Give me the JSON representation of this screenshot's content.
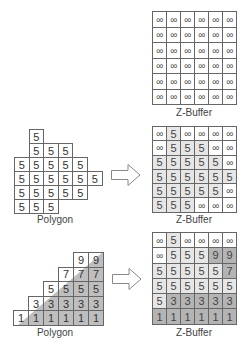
{
  "top": {
    "zbuffer": {
      "label": "Z-Buffer",
      "rows": [
        [
          "∞",
          "∞",
          "∞",
          "∞",
          "∞",
          "∞"
        ],
        [
          "∞",
          "∞",
          "∞",
          "∞",
          "∞",
          "∞"
        ],
        [
          "∞",
          "∞",
          "∞",
          "∞",
          "∞",
          "∞"
        ],
        [
          "∞",
          "∞",
          "∞",
          "∞",
          "∞",
          "∞"
        ],
        [
          "∞",
          "∞",
          "∞",
          "∞",
          "∞",
          "∞"
        ],
        [
          "∞",
          "∞",
          "∞",
          "∞",
          "∞",
          "∞"
        ]
      ]
    }
  },
  "middle": {
    "polygon": {
      "label": "Polygon",
      "rows": [
        {
          "start": 1,
          "values": [
            "5"
          ]
        },
        {
          "start": 1,
          "values": [
            "5",
            "5",
            "5"
          ]
        },
        {
          "start": 0,
          "values": [
            "5",
            "5",
            "5",
            "5",
            "5"
          ]
        },
        {
          "start": 0,
          "values": [
            "5",
            "5",
            "5",
            "5",
            "5",
            "5"
          ]
        },
        {
          "start": 0,
          "values": [
            "5",
            "5",
            "5",
            "5",
            "5"
          ]
        },
        {
          "start": 0,
          "values": [
            "5",
            "5",
            "5"
          ]
        }
      ]
    },
    "zbuffer": {
      "label": "Z-Buffer",
      "rows": [
        [
          "∞",
          "5",
          "∞",
          "∞",
          "∞",
          "∞"
        ],
        [
          "∞",
          "5",
          "5",
          "5",
          "∞",
          "∞"
        ],
        [
          "5",
          "5",
          "5",
          "5",
          "5",
          "∞"
        ],
        [
          "5",
          "5",
          "5",
          "5",
          "5",
          "5"
        ],
        [
          "5",
          "5",
          "5",
          "5",
          "5",
          "∞"
        ],
        [
          "5",
          "5",
          "5",
          "∞",
          "∞",
          "∞"
        ]
      ],
      "shade": [
        [
          0,
          1,
          0,
          0,
          0,
          0
        ],
        [
          0,
          1,
          1,
          1,
          0,
          0
        ],
        [
          1,
          1,
          1,
          1,
          1,
          0
        ],
        [
          1,
          1,
          1,
          1,
          1,
          1
        ],
        [
          1,
          1,
          1,
          1,
          1,
          0
        ],
        [
          1,
          1,
          1,
          0,
          0,
          0
        ]
      ]
    }
  },
  "bottom": {
    "polygon": {
      "label": "Polygon",
      "rows": [
        {
          "start": 4,
          "values": [
            "9",
            "9"
          ]
        },
        {
          "start": 3,
          "values": [
            "7",
            "7",
            "7"
          ]
        },
        {
          "start": 2,
          "values": [
            "5",
            "5",
            "5",
            "5"
          ]
        },
        {
          "start": 1,
          "values": [
            "3",
            "3",
            "3",
            "3",
            "3"
          ]
        },
        {
          "start": 0,
          "values": [
            "1",
            "1",
            "1",
            "1",
            "1",
            "1"
          ]
        }
      ]
    },
    "zbuffer": {
      "label": "Z-Buffer",
      "rows": [
        [
          "∞",
          "5",
          "∞",
          "∞",
          "∞",
          "∞"
        ],
        [
          "∞",
          "5",
          "5",
          "5",
          "9",
          "9"
        ],
        [
          "5",
          "5",
          "5",
          "5",
          "5",
          "7"
        ],
        [
          "5",
          "5",
          "5",
          "5",
          "5",
          "5"
        ],
        [
          "5",
          "3",
          "3",
          "3",
          "3",
          "3"
        ],
        [
          "1",
          "1",
          "1",
          "1",
          "1",
          "1"
        ]
      ],
      "shade": [
        [
          0,
          1,
          0,
          0,
          0,
          0
        ],
        [
          0,
          1,
          1,
          1,
          2,
          2
        ],
        [
          1,
          1,
          1,
          1,
          1,
          2
        ],
        [
          1,
          1,
          1,
          1,
          1,
          1
        ],
        [
          1,
          2,
          2,
          2,
          2,
          2
        ],
        [
          2,
          2,
          2,
          2,
          2,
          2
        ]
      ]
    }
  },
  "colors": {
    "grid_line": "#666666",
    "shade_light": "#e6e6e6",
    "shade_dark": "#b4b4b4",
    "triangle_fill": "#a8a8a8"
  }
}
